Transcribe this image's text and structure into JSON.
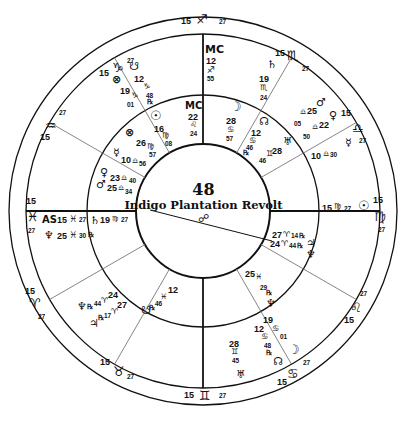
{
  "chart": {
    "number": "48",
    "title": "Indigo Plantation Revolt",
    "center_glyph": "☍",
    "colors": {
      "ink": "#111111",
      "background": "#ffffff",
      "thin_line": "#777777"
    }
  },
  "outer_ring_signs": [
    {
      "deg": "15",
      "sign": "♐",
      "min": "27",
      "pos": "top"
    },
    {
      "deg": "15",
      "sign": "♏",
      "min": "27",
      "pos": "top-right"
    },
    {
      "deg": "15",
      "sign": "♎",
      "min": "27",
      "pos": "right-upper"
    },
    {
      "deg": "15",
      "sign": "♍",
      "min": "27",
      "pos": "right"
    },
    {
      "deg": "15",
      "sign": "♌",
      "min": "27",
      "pos": "right-lower"
    },
    {
      "deg": "15",
      "sign": "♋",
      "min": "27",
      "pos": "bottom-right"
    },
    {
      "deg": "15",
      "sign": "♊",
      "min": "27",
      "pos": "bottom"
    },
    {
      "deg": "15",
      "sign": "♉",
      "min": "27",
      "pos": "bottom-left"
    },
    {
      "deg": "15",
      "sign": "♈",
      "min": "27",
      "pos": "left-lower"
    },
    {
      "deg": "15",
      "sign": "♓",
      "min": "27",
      "pos": "left"
    },
    {
      "deg": "15",
      "sign": "♒",
      "min": "27",
      "pos": "left-upper"
    },
    {
      "deg": "15",
      "sign": "♑",
      "min": "27",
      "pos": "top-left"
    }
  ],
  "outer_ring_planets": {
    "mc": {
      "glyph": "MC",
      "deg": "12",
      "sign": "♐",
      "min": "55"
    },
    "saturn": {
      "glyph": "♄",
      "deg": "19",
      "sign": "♏",
      "min": "24"
    },
    "mars": {
      "glyph": "♂",
      "deg": "25",
      "sign": "♎",
      "min": "05"
    },
    "venus": {
      "glyph": "♀",
      "deg": "22",
      "sign": "♎",
      "min": "50"
    },
    "mercury": {
      "glyph": "☿",
      "deg": "10",
      "sign": "♎",
      "min": "30"
    },
    "sun": {
      "glyph": "☉",
      "deg": "15",
      "sign": "♍",
      "min": "27"
    },
    "jupiter": {
      "glyph": "♃",
      "deg": "27",
      "sign": "♈",
      "min": "14",
      "retro": "℞"
    },
    "neptune_r": {
      "glyph": "♆",
      "deg": "24",
      "sign": "♈",
      "min": "44",
      "retro": "℞"
    },
    "pluto": {
      "glyph": "♆",
      "deg": "25",
      "sign": "♓",
      "min": "29",
      "retro": "℞"
    },
    "moon": {
      "glyph": "☽",
      "deg": "19",
      "sign": "♋",
      "min": "01"
    },
    "node": {
      "glyph": "☊",
      "deg": "12",
      "sign": "♋",
      "min": "48",
      "retro": "℞"
    },
    "uranus": {
      "glyph": "♅",
      "deg": "28",
      "sign": "♊",
      "min": "45"
    },
    "asc": {
      "glyph": "AS",
      "deg": "15",
      "sign": "♓",
      "min": "27"
    },
    "neptune": {
      "glyph": "♆",
      "deg": "25",
      "sign": "♓",
      "min": "30",
      "retro": "℞"
    },
    "saturn_in": {
      "glyph": "♄",
      "deg": "19",
      "sign": "♍",
      "min": "27"
    },
    "south_node": {
      "glyph": "☋",
      "deg": "12",
      "sign": "♑",
      "min": "48",
      "retro": "℞"
    },
    "fortune": {
      "glyph": "⊗",
      "deg": "19",
      "sign": "♑",
      "min": "01"
    }
  },
  "inner_ring_planets": {
    "mc": {
      "glyph": "MC",
      "deg": "22",
      "sign": "♌",
      "min": "24"
    },
    "moon": {
      "glyph": "☽",
      "deg": "28",
      "sign": "♋",
      "min": "57"
    },
    "node": {
      "glyph": "☊",
      "deg": "12",
      "sign": "♋",
      "min": "46",
      "retro": "℞"
    },
    "uranus": {
      "glyph": "♅",
      "deg": "28",
      "sign": "♊",
      "min": "46"
    },
    "mars": {
      "glyph": "♂",
      "deg": "25",
      "sign": "♎",
      "min": "05"
    },
    "venus": {
      "glyph": "♀",
      "deg": "22",
      "sign": "♎",
      "min": "50"
    },
    "mercury": {
      "glyph": "☿",
      "deg": "10",
      "sign": "♎",
      "min": "30"
    },
    "sun": {
      "glyph": "☉",
      "deg": "16",
      "sign": "♍",
      "min": "08"
    },
    "fortune": {
      "glyph": "⊗",
      "deg": "26",
      "sign": "♍",
      "min": "57"
    },
    "mercury2": {
      "glyph": "☿",
      "deg": "10",
      "sign": "♎",
      "min": "56"
    },
    "venus2": {
      "glyph": "♀",
      "deg": "23",
      "sign": "♎",
      "min": "40"
    },
    "mars2": {
      "glyph": "♂",
      "deg": "25",
      "sign": "♎",
      "min": "34"
    },
    "south_node": {
      "glyph": "☋",
      "deg": "12",
      "sign": "♓",
      "min": "46",
      "retro": "℞"
    },
    "neptune": {
      "glyph": "♆",
      "deg": "24",
      "sign": "♈",
      "min": "44",
      "retro": "℞"
    },
    "jupiter": {
      "glyph": "♃",
      "deg": "27",
      "sign": "♈",
      "min": "17",
      "retro": "℞"
    },
    "jupiter_r": {
      "glyph": "♃",
      "deg": "27",
      "sign": "♈",
      "min": "14",
      "retro": "℞"
    },
    "neptune_r": {
      "glyph": "♆",
      "deg": "24",
      "sign": "♈",
      "min": "44",
      "retro": "℞"
    },
    "pluto": {
      "glyph": "♆",
      "deg": "25",
      "sign": "♓",
      "min": "29",
      "retro": "℞"
    },
    "asc_sign": {
      "deg": "15",
      "sign": "♍",
      "min": "27"
    }
  }
}
